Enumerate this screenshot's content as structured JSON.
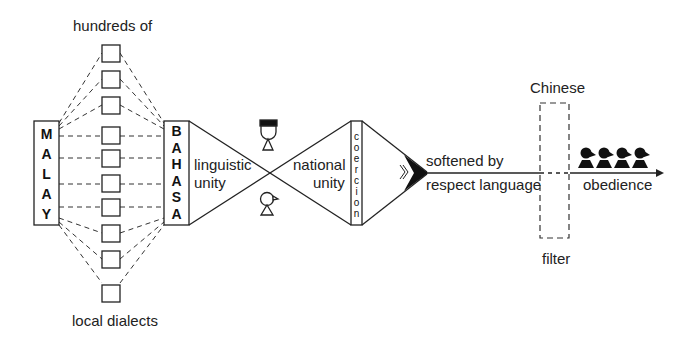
{
  "labels": {
    "top": "hundreds of",
    "bottom": "local dialects",
    "linguistic": [
      "linguistic",
      "unity"
    ],
    "national": [
      "national",
      "unity"
    ],
    "softened": "softened by",
    "respect": "respect language",
    "chinese": "Chinese",
    "filter": "filter",
    "obedience": "obedience"
  },
  "boxes": {
    "malay": [
      "M",
      "A",
      "L",
      "A",
      "Y"
    ],
    "bahasa": [
      "B",
      "A",
      "H",
      "A",
      "S",
      "A"
    ],
    "coercion": [
      "c",
      "o",
      "e",
      "r",
      "c",
      "i",
      "o",
      "n"
    ]
  },
  "dialect_count": 10,
  "figure_count": 4,
  "colors": {
    "stroke": "#1a1a1a",
    "background": "#ffffff"
  }
}
